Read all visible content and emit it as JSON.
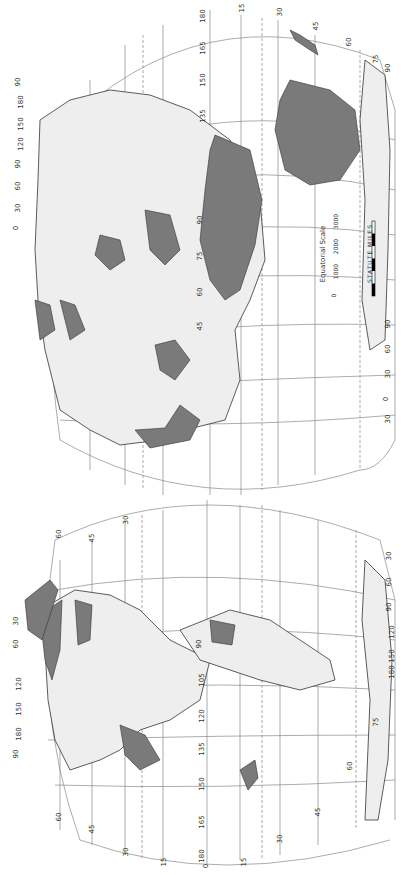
{
  "map": {
    "type": "interrupted world map (rotated 90°)",
    "shading": {
      "land": "#eeeeee",
      "highlighted_regions": "#7a7a7a",
      "water": "#ffffff",
      "lines": "#888888"
    },
    "scale": {
      "title": "Equatorial Scale",
      "ticks": [
        "0",
        "1000",
        "2000",
        "3000"
      ],
      "units": "STATUTE MILES"
    },
    "eastern_hemisphere": {
      "latitude_labels_left": [
        "90",
        "75",
        "60",
        "45",
        "30",
        "15",
        "0",
        "15",
        "30",
        "45",
        "60",
        "75",
        "90"
      ],
      "longitude_labels_top": [
        "15",
        "30",
        "45",
        "60",
        "75",
        "90"
      ],
      "longitude_labels_edge": [
        "180",
        "165",
        "150",
        "135",
        "120",
        "105",
        "90",
        "75",
        "60",
        "45"
      ],
      "polar_labels_left": [
        "90",
        "180",
        "150",
        "120",
        "90",
        "60",
        "30",
        "0",
        "30",
        "90"
      ],
      "polar_labels_right": [
        "90",
        "180",
        "150",
        "120",
        "90",
        "60",
        "30",
        "0",
        "30",
        "60",
        "90"
      ]
    },
    "western_hemisphere": {
      "latitude_labels": [
        "60",
        "45",
        "30",
        "15",
        "0",
        "15",
        "30",
        "45",
        "60",
        "75"
      ],
      "longitude_labels": [
        "180",
        "165",
        "150",
        "135",
        "120",
        "105",
        "90",
        "75",
        "60",
        "45",
        "30",
        "15",
        "0"
      ],
      "polar_labels_left": [
        "60",
        "30",
        "0",
        "30",
        "60",
        "90",
        "120",
        "150",
        "180",
        "90"
      ],
      "polar_labels_right": [
        "90",
        "30",
        "60",
        "90",
        "120",
        "150",
        "180",
        "90"
      ]
    }
  }
}
